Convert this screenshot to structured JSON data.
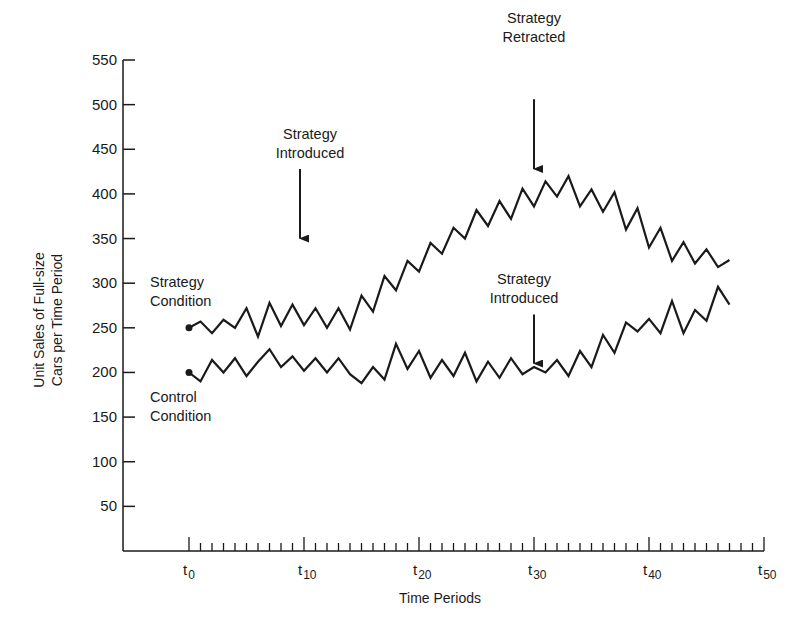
{
  "chart_data": {
    "type": "line",
    "title": "",
    "xlabel": "Time Periods",
    "ylabel": "Unit Sales of Full-size Cars per Time Period",
    "ylabel_lines": [
      "Unit Sales of Full-size",
      "Cars per Time Period"
    ],
    "ylim": [
      0,
      550
    ],
    "xlim": [
      0,
      50
    ],
    "grid": false,
    "y_ticks": [
      50,
      100,
      150,
      200,
      250,
      300,
      350,
      400,
      450,
      500,
      550
    ],
    "x_ticks": [
      {
        "t": 0,
        "base": "t",
        "sub": "0"
      },
      {
        "t": 10,
        "base": "t",
        "sub": "10"
      },
      {
        "t": 20,
        "base": "t",
        "sub": "20"
      },
      {
        "t": 30,
        "base": "t",
        "sub": "30"
      },
      {
        "t": 40,
        "base": "t",
        "sub": "40"
      },
      {
        "t": 50,
        "base": "t",
        "sub": "50"
      }
    ],
    "series": [
      {
        "name": "Strategy Condition",
        "label_lines": [
          "Strategy",
          "Condition"
        ],
        "x": [
          0,
          1,
          2,
          3,
          4,
          5,
          6,
          7,
          8,
          9,
          10,
          11,
          12,
          13,
          14,
          15,
          16,
          17,
          18,
          19,
          20,
          21,
          22,
          23,
          24,
          25,
          26,
          27,
          28,
          29,
          30,
          31,
          32,
          33,
          34,
          35,
          36,
          37,
          38,
          39,
          40,
          41,
          42,
          43,
          44,
          45,
          46,
          47
        ],
        "values": [
          250,
          257,
          244,
          259,
          250,
          272,
          240,
          278,
          252,
          276,
          253,
          272,
          250,
          272,
          248,
          286,
          268,
          308,
          292,
          325,
          313,
          345,
          333,
          362,
          350,
          382,
          364,
          392,
          372,
          406,
          386,
          414,
          397,
          420,
          386,
          405,
          380,
          402,
          360,
          384,
          340,
          362,
          325,
          346,
          322,
          338,
          318,
          326
        ]
      },
      {
        "name": "Control Condition",
        "label_lines": [
          "Control",
          "Condition"
        ],
        "x": [
          0,
          1,
          2,
          3,
          4,
          5,
          6,
          7,
          8,
          9,
          10,
          11,
          12,
          13,
          14,
          15,
          16,
          17,
          18,
          19,
          20,
          21,
          22,
          23,
          24,
          25,
          26,
          27,
          28,
          29,
          30,
          31,
          32,
          33,
          34,
          35,
          36,
          37,
          38,
          39,
          40,
          41,
          42,
          43,
          44,
          45,
          46,
          47
        ],
        "values": [
          200,
          190,
          214,
          200,
          216,
          196,
          212,
          226,
          206,
          218,
          202,
          216,
          200,
          216,
          198,
          188,
          206,
          192,
          232,
          204,
          224,
          194,
          214,
          196,
          222,
          190,
          212,
          194,
          216,
          198,
          206,
          200,
          214,
          196,
          224,
          206,
          242,
          222,
          256,
          246,
          260,
          244,
          280,
          244,
          270,
          258,
          296,
          276
        ]
      }
    ],
    "annotations": [
      {
        "label_lines": [
          "Strategy",
          "Introduced"
        ],
        "series": "Strategy Condition",
        "t": 10,
        "arrow_from": 428,
        "arrow_to": 350
      },
      {
        "label_lines": [
          "Strategy",
          "Retracted"
        ],
        "series": "Strategy Condition",
        "t": 30,
        "arrow_from": 506,
        "arrow_to": 428
      },
      {
        "label_lines": [
          "Strategy",
          "Introduced"
        ],
        "series": "Control Condition",
        "t": 30,
        "arrow_from": 265,
        "arrow_to": 210
      }
    ]
  },
  "style": {
    "ink": "#1a1a1a",
    "background": "#ffffff"
  }
}
